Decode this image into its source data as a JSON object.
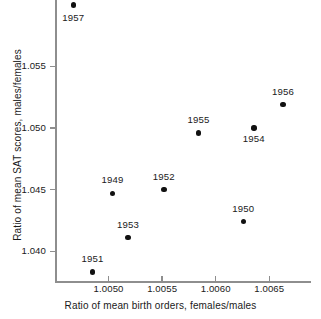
{
  "chart_data": {
    "type": "scatter",
    "title": "",
    "xlabel": "Ratio of mean birth orders, females/males",
    "ylabel": "Ratio of mean SAT scores, males/females",
    "xlim": [
      1.0045,
      1.00688
    ],
    "ylim": [
      1.0375,
      1.0604
    ],
    "grid": false,
    "legend": null,
    "xticks": [
      1.005,
      1.0055,
      1.006,
      1.0065
    ],
    "xtick_labels": [
      "1.0050",
      "1.0055",
      "1.0060",
      "1.0065"
    ],
    "yticks": [
      1.04,
      1.045,
      1.05,
      1.055
    ],
    "ytick_labels": [
      "1.040",
      "1.045",
      "1.050",
      "1.055"
    ],
    "point_labels": [
      "1949",
      "1950",
      "1951",
      "1952",
      "1953",
      "1954",
      "1955",
      "1956",
      "1957"
    ],
    "points": [
      {
        "label": "1949",
        "x": 1.005037,
        "y": 1.0447,
        "label_dx": 0,
        "label_dy": -13
      },
      {
        "label": "1950",
        "x": 1.006258,
        "y": 1.0424,
        "label_dx": 0,
        "label_dy": -13
      },
      {
        "label": "1951",
        "x": 1.004851,
        "y": 1.0383,
        "label_dx": 0,
        "label_dy": -13
      },
      {
        "label": "1952",
        "x": 1.005516,
        "y": 1.045,
        "label_dx": 0,
        "label_dy": -13
      },
      {
        "label": "1953",
        "x": 1.005182,
        "y": 1.0411,
        "label_dx": 0,
        "label_dy": -13
      },
      {
        "label": "1954",
        "x": 1.006356,
        "y": 1.05,
        "label_dx": 0,
        "label_dy": 11
      },
      {
        "label": "1955",
        "x": 1.00584,
        "y": 1.0496,
        "label_dx": 0,
        "label_dy": -13
      },
      {
        "label": "1956",
        "x": 1.006628,
        "y": 1.0519,
        "label_dx": 0,
        "label_dy": -13
      },
      {
        "label": "1957",
        "x": 1.00467,
        "y": 1.06,
        "label_dx": 0,
        "label_dy": 13
      }
    ],
    "marker": {
      "shape": "circle",
      "color": "#111111",
      "size_px": 5.4
    },
    "axis_color": "#8e8e8e"
  }
}
